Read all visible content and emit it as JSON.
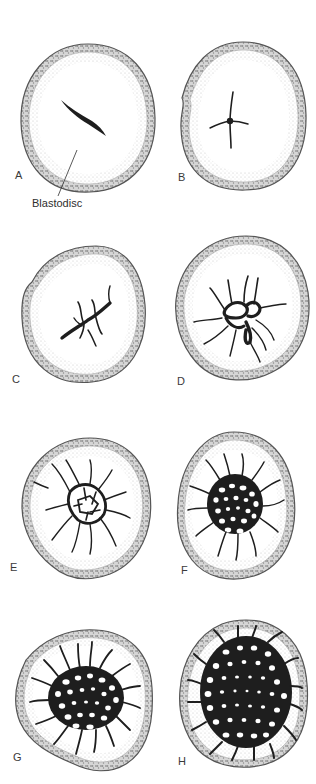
{
  "figure": {
    "panels": [
      {
        "id": "A",
        "label": "A",
        "stage": "single streak"
      },
      {
        "id": "B",
        "label": "B",
        "stage": "cross-shaped"
      },
      {
        "id": "C",
        "label": "C",
        "stage": "branching"
      },
      {
        "id": "D",
        "label": "D",
        "stage": "early network"
      },
      {
        "id": "E",
        "label": "E",
        "stage": "expanding network"
      },
      {
        "id": "F",
        "label": "F",
        "stage": "dense network"
      },
      {
        "id": "G",
        "label": "G",
        "stage": "large network"
      },
      {
        "id": "H",
        "label": "H",
        "stage": "full network"
      }
    ],
    "callout": {
      "label": "Blastodisc",
      "points_to": "A"
    },
    "colors": {
      "ink": "#1e1e1e",
      "shell_stipple": "#8a8a8a",
      "albumen_stipple": "#c9c9c9",
      "background": "#ffffff"
    }
  }
}
